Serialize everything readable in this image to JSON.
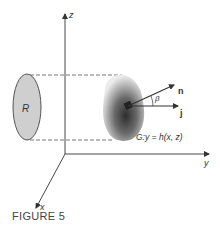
{
  "figure": {
    "caption": "FIGURE 5",
    "axes": {
      "z_label": "z",
      "y_label": "y",
      "x_label": "x"
    },
    "region_label": "R",
    "surface_label": "G:y = h(x, z)",
    "vectors": {
      "normal_label": "n",
      "unit_label": "j",
      "angle_label": "β"
    },
    "colors": {
      "line": "#333333",
      "region_fill": "#cfcfcf",
      "surface_dark": "#3a3a3a",
      "surface_light": "#e6e6e6"
    }
  }
}
